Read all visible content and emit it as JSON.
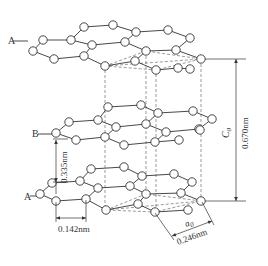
{
  "figure": {
    "atom_radius": 4.2,
    "colors": {
      "line": "#333333",
      "dash": "#555555",
      "atom_fill": "#ffffff",
      "background": "#ffffff"
    }
  },
  "layers": [
    {
      "id": "top",
      "label": "A",
      "label_pos": [
        8,
        44
      ],
      "label_leader": [
        [
          13,
          41
        ],
        [
          28,
          41
        ]
      ],
      "atoms": [
        [
          84,
          27
        ],
        [
          113,
          25
        ],
        [
          136,
          32
        ],
        [
          168,
          30
        ],
        [
          190,
          38
        ],
        [
          43,
          40
        ],
        [
          71,
          40
        ],
        [
          92,
          45
        ],
        [
          125,
          42
        ],
        [
          146,
          51
        ],
        [
          176,
          50
        ],
        [
          33,
          51
        ],
        [
          54,
          59
        ],
        [
          84,
          56
        ],
        [
          105,
          66
        ],
        [
          135,
          61
        ],
        [
          156,
          70
        ],
        [
          178,
          68
        ],
        [
          201,
          59
        ],
        [
          190,
          69
        ]
      ],
      "bonds": [
        [
          0,
          1
        ],
        [
          1,
          2
        ],
        [
          2,
          3
        ],
        [
          3,
          4
        ],
        [
          0,
          6
        ],
        [
          2,
          8
        ],
        [
          4,
          10
        ],
        [
          5,
          6
        ],
        [
          6,
          7
        ],
        [
          7,
          8
        ],
        [
          8,
          9
        ],
        [
          9,
          10
        ],
        [
          5,
          11
        ],
        [
          11,
          12
        ],
        [
          12,
          13
        ],
        [
          13,
          7
        ],
        [
          13,
          14
        ],
        [
          14,
          15
        ],
        [
          15,
          9
        ],
        [
          15,
          16
        ],
        [
          16,
          17
        ],
        [
          10,
          18
        ],
        [
          17,
          19
        ]
      ]
    },
    {
      "id": "middle",
      "label": "B",
      "label_pos": [
        32,
        137
      ],
      "label_leader": [
        [
          38,
          134
        ],
        [
          52,
          134
        ]
      ],
      "atoms": [
        [
          108,
          107
        ],
        [
          141,
          105
        ],
        [
          158,
          113
        ],
        [
          193,
          111
        ],
        [
          212,
          119
        ],
        [
          69,
          122
        ],
        [
          98,
          120
        ],
        [
          116,
          127
        ],
        [
          146,
          124
        ],
        [
          166,
          132
        ],
        [
          199,
          129
        ],
        [
          56,
          133
        ],
        [
          76,
          140
        ],
        [
          105,
          137
        ],
        [
          124,
          145
        ],
        [
          155,
          142
        ],
        [
          179,
          140
        ],
        [
          200,
          130
        ]
      ],
      "bonds": [
        [
          0,
          1
        ],
        [
          1,
          2
        ],
        [
          2,
          3
        ],
        [
          3,
          4
        ],
        [
          0,
          6
        ],
        [
          2,
          8
        ],
        [
          4,
          10
        ],
        [
          5,
          6
        ],
        [
          6,
          7
        ],
        [
          7,
          8
        ],
        [
          8,
          9
        ],
        [
          9,
          10
        ],
        [
          5,
          11
        ],
        [
          11,
          12
        ],
        [
          12,
          13
        ],
        [
          13,
          7
        ],
        [
          13,
          14
        ],
        [
          14,
          15
        ],
        [
          15,
          9
        ],
        [
          15,
          16
        ]
      ]
    },
    {
      "id": "bottom",
      "label": "A",
      "label_pos": [
        24,
        200
      ],
      "label_leader": [
        [
          30,
          196
        ],
        [
          40,
          196
        ]
      ],
      "atoms": [
        [
          91,
          169
        ],
        [
          124,
          167
        ],
        [
          142,
          176
        ],
        [
          174,
          174
        ],
        [
          192,
          182
        ],
        [
          52,
          183
        ],
        [
          80,
          181
        ],
        [
          98,
          188
        ],
        [
          130,
          186
        ],
        [
          146,
          194
        ],
        [
          181,
          193
        ],
        [
          40,
          194
        ],
        [
          56,
          201
        ],
        [
          86,
          199
        ],
        [
          106,
          210
        ],
        [
          138,
          204
        ],
        [
          155,
          212
        ],
        [
          188,
          210
        ],
        [
          201,
          201
        ]
      ],
      "bonds": [
        [
          0,
          1
        ],
        [
          1,
          2
        ],
        [
          2,
          3
        ],
        [
          3,
          4
        ],
        [
          0,
          6
        ],
        [
          2,
          8
        ],
        [
          4,
          10
        ],
        [
          5,
          6
        ],
        [
          6,
          7
        ],
        [
          7,
          8
        ],
        [
          8,
          9
        ],
        [
          9,
          10
        ],
        [
          5,
          11
        ],
        [
          11,
          12
        ],
        [
          12,
          13
        ],
        [
          13,
          7
        ],
        [
          13,
          14
        ],
        [
          14,
          15
        ],
        [
          15,
          9
        ],
        [
          15,
          16
        ],
        [
          16,
          17
        ],
        [
          10,
          18
        ]
      ]
    }
  ],
  "unit_cell": {
    "vertical_dashes": [
      {
        "x": 105,
        "y1": 70,
        "y2": 210
      },
      {
        "x": 146,
        "y1": 56,
        "y2": 190
      },
      {
        "x": 156,
        "y1": 74,
        "y2": 208
      },
      {
        "x": 201,
        "y1": 64,
        "y2": 197
      }
    ],
    "top_parallelogram": [
      [
        105,
        66
      ],
      [
        146,
        51
      ],
      [
        201,
        59
      ],
      [
        156,
        70
      ]
    ],
    "bottom_parallelogram": [
      [
        106,
        210
      ],
      [
        146,
        194
      ],
      [
        201,
        201
      ],
      [
        155,
        212
      ]
    ]
  },
  "dimensions": {
    "interlayer": {
      "label": "0.335nm",
      "x": 56,
      "y1": 140,
      "y2": 194,
      "text_x": 67,
      "text_y": 167
    },
    "bond_length": {
      "label": "0.142nm",
      "x1": 56,
      "x2": 86,
      "y": 218,
      "text_x": 58,
      "text_y": 232
    },
    "c0": {
      "symbol": "C",
      "subscript": "0",
      "label": "0.670nm",
      "x": 236,
      "y1": 59,
      "y2": 201,
      "symbol_x": 229,
      "symbol_y": 133,
      "text_x": 248,
      "text_y": 133
    },
    "a0": {
      "symbol": "a",
      "subscript": "0",
      "label": "0.246nm",
      "p1": [
        172,
        236
      ],
      "p2": [
        212,
        221
      ],
      "text_x": 178,
      "text_y": 245
    }
  }
}
